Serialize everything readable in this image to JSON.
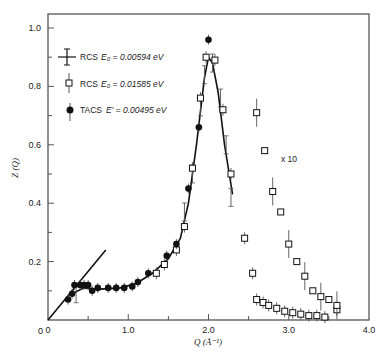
{
  "chart_data": {
    "type": "scatter",
    "title": "",
    "xlabel": "Q (Å⁻¹)",
    "ylabel": "Z(Q)",
    "xlim": [
      0,
      4.0
    ],
    "ylim": [
      0,
      1.05
    ],
    "x_ticks": [
      "0",
      "1.0",
      "2.0",
      "3.0",
      "4.0"
    ],
    "y_ticks": [
      "0",
      "0.2",
      "0.4",
      "0.6",
      "0.8",
      "1.0"
    ],
    "grid": false,
    "legend_position": "upper-left",
    "annotations": [
      "x 10"
    ],
    "series": [
      {
        "name": "RCS E0 = 0.00594 eV",
        "marker": "errorbar-cross",
        "points": [
          [
            0.35,
            0.09
          ],
          [
            1.7,
            0.37
          ],
          [
            1.8,
            0.5
          ],
          [
            1.9,
            0.73
          ],
          [
            1.95,
            0.84
          ],
          [
            2.05,
            0.88
          ],
          [
            2.15,
            0.76
          ],
          [
            2.22,
            0.6
          ],
          [
            2.28,
            0.42
          ]
        ]
      },
      {
        "name": "RCS E0 = 0.01585 eV",
        "marker": "open-square",
        "points": [
          [
            1.35,
            0.16
          ],
          [
            1.45,
            0.19
          ],
          [
            1.6,
            0.24
          ],
          [
            1.7,
            0.32
          ],
          [
            1.8,
            0.52
          ],
          [
            1.9,
            0.76
          ],
          [
            1.97,
            0.9
          ],
          [
            2.08,
            0.89
          ],
          [
            2.18,
            0.72
          ],
          [
            2.28,
            0.5
          ],
          [
            2.45,
            0.28
          ],
          [
            2.55,
            0.16
          ],
          [
            2.6,
            0.07
          ],
          [
            2.68,
            0.06
          ],
          [
            2.75,
            0.05
          ],
          [
            2.85,
            0.04
          ],
          [
            2.95,
            0.03
          ],
          [
            3.05,
            0.025
          ],
          [
            3.15,
            0.02
          ],
          [
            3.25,
            0.015
          ],
          [
            3.35,
            0.015
          ],
          [
            3.45,
            0.01
          ],
          [
            3.6,
            0.035
          ]
        ]
      },
      {
        "name": "RCS E0 = 0.01585 eV (x10)",
        "marker": "open-square",
        "points": [
          [
            2.6,
            0.71
          ],
          [
            2.7,
            0.58
          ],
          [
            2.8,
            0.44
          ],
          [
            2.9,
            0.37
          ],
          [
            3.0,
            0.26
          ],
          [
            3.1,
            0.2
          ],
          [
            3.2,
            0.15
          ],
          [
            3.3,
            0.1
          ],
          [
            3.4,
            0.08
          ],
          [
            3.5,
            0.07
          ],
          [
            3.6,
            0.05
          ]
        ]
      },
      {
        "name": "TACS E' = 0.00495 eV",
        "marker": "filled-circle",
        "points": [
          [
            0.25,
            0.07
          ],
          [
            0.3,
            0.09
          ],
          [
            0.33,
            0.12
          ],
          [
            0.4,
            0.12
          ],
          [
            0.45,
            0.12
          ],
          [
            0.5,
            0.12
          ],
          [
            0.55,
            0.1
          ],
          [
            0.62,
            0.11
          ],
          [
            0.75,
            0.11
          ],
          [
            0.85,
            0.11
          ],
          [
            0.95,
            0.11
          ],
          [
            1.05,
            0.115
          ],
          [
            1.12,
            0.13
          ],
          [
            1.25,
            0.16
          ],
          [
            1.48,
            0.22
          ],
          [
            1.6,
            0.26
          ],
          [
            1.75,
            0.45
          ],
          [
            1.88,
            0.66
          ],
          [
            2.0,
            0.96
          ]
        ]
      }
    ],
    "lines": [
      {
        "name": "low-Q linear",
        "points": [
          [
            0,
            0
          ],
          [
            0.72,
            0.24
          ]
        ]
      },
      {
        "name": "fit curve",
        "points": [
          [
            0.3,
            0.09
          ],
          [
            0.45,
            0.11
          ],
          [
            0.6,
            0.105
          ],
          [
            0.9,
            0.11
          ],
          [
            1.1,
            0.125
          ],
          [
            1.3,
            0.16
          ],
          [
            1.5,
            0.21
          ],
          [
            1.65,
            0.28
          ],
          [
            1.75,
            0.4
          ],
          [
            1.85,
            0.6
          ],
          [
            1.95,
            0.83
          ],
          [
            2.0,
            0.9
          ],
          [
            2.05,
            0.88
          ],
          [
            2.12,
            0.78
          ],
          [
            2.2,
            0.6
          ],
          [
            2.3,
            0.43
          ]
        ]
      }
    ]
  },
  "legend": {
    "items": [
      {
        "label": "RCS",
        "param": "E₀ = 0.00594 eV"
      },
      {
        "label": "RCS",
        "param": "E₀ = 0.01585 eV"
      },
      {
        "label": "TACS",
        "param": "E′ = 0.00495 eV"
      }
    ]
  },
  "annotation": "x 10",
  "axes": {
    "x_title": "Q (Å⁻¹)",
    "y_title": "Z (Q)"
  }
}
